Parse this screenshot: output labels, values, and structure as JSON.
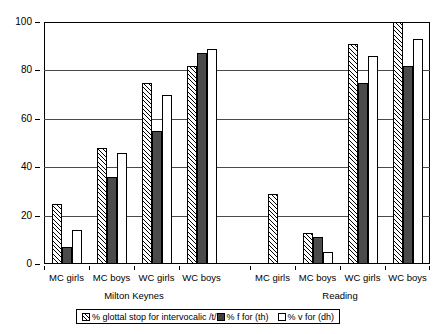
{
  "chart_data": {
    "type": "bar",
    "title": "",
    "subtitle": "",
    "xlabel": "",
    "ylabel": "",
    "ylim": [
      0,
      100
    ],
    "yticks": [
      0,
      20,
      40,
      60,
      80,
      100
    ],
    "grid": true,
    "legend_position": "bottom",
    "categories": [
      "MC girls",
      "MC boys",
      "WC girls",
      "WC boys",
      "MC girls",
      "MC boys",
      "WC girls",
      "WC boys"
    ],
    "blocks": [
      {
        "region": "Milton Keynes",
        "groups": [
          {
            "label": "MC girls",
            "values": [
              25,
              7,
              14
            ]
          },
          {
            "label": "MC boys",
            "values": [
              48,
              36,
              46
            ]
          },
          {
            "label": "WC girls",
            "values": [
              75,
              55,
              70
            ]
          },
          {
            "label": "WC boys",
            "values": [
              82,
              87,
              89
            ]
          }
        ]
      },
      {
        "region": "Reading",
        "groups": [
          {
            "label": "MC girls",
            "values": [
              29,
              0,
              0
            ]
          },
          {
            "label": "MC boys",
            "values": [
              13,
              11,
              5
            ]
          },
          {
            "label": "WC girls",
            "values": [
              91,
              75,
              86
            ]
          },
          {
            "label": "WC boys",
            "values": [
              100,
              82,
              93
            ]
          }
        ]
      }
    ],
    "series": [
      {
        "name": "% glottal stop for intervocalic /t/",
        "pattern": "diagonal-hatch",
        "color": "#ffffff",
        "values": [
          25,
          48,
          75,
          82,
          29,
          13,
          91,
          100
        ]
      },
      {
        "name": "% f for (th)",
        "pattern": "solid",
        "color": "#4b4b4b",
        "values": [
          7,
          36,
          55,
          87,
          0,
          11,
          75,
          82
        ]
      },
      {
        "name": "% v for (dh)",
        "pattern": "open",
        "color": "#ffffff",
        "values": [
          14,
          46,
          70,
          89,
          0,
          5,
          86,
          93
        ]
      }
    ]
  },
  "legend": {
    "items": [
      {
        "label": "% glottal stop for intervocalic /t/"
      },
      {
        "label": "% f for (th)"
      },
      {
        "label": "% v for (dh)"
      }
    ]
  },
  "axis": {
    "y_tick_labels": [
      "100",
      "80",
      "60",
      "40",
      "20",
      "0"
    ]
  },
  "regions": {
    "left": "Milton Keynes",
    "right": "Reading"
  }
}
